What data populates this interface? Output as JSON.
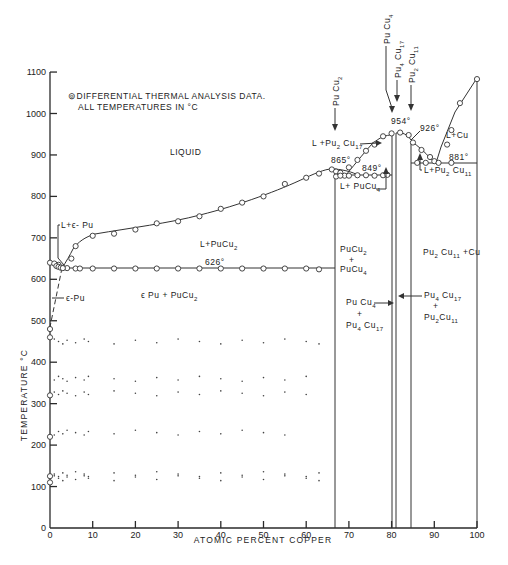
{
  "chart_data": {
    "type": "scatter",
    "xlabel": "ATOMIC PERCENT COPPER",
    "ylabel": "TEMPERATURE °C",
    "xlim": [
      0,
      100
    ],
    "ylim": [
      0,
      1100
    ],
    "x_ticks": [
      0,
      10,
      20,
      30,
      40,
      50,
      60,
      70,
      80,
      90,
      100
    ],
    "y_ticks": [
      0,
      100,
      200,
      300,
      400,
      500,
      600,
      700,
      800,
      900,
      1000,
      1100
    ],
    "grid": false,
    "legend_note": [
      "⊚DIFFERENTIAL THERMAL ANALYSIS DATA.",
      "ALL TEMPERATURES IN °C"
    ],
    "compound_lines": [
      {
        "name": "PuCu2",
        "x": 66.7,
        "top": 865
      },
      {
        "name": "PuCu4",
        "x": 80.0,
        "top": 950
      },
      {
        "name": "Pu4Cu17",
        "x": 81.0,
        "top": 954
      },
      {
        "name": "Pu2Cu11",
        "x": 84.6,
        "top": 926
      },
      {
        "name": "Cu",
        "x": 100.0,
        "top": 1083
      }
    ],
    "isotherms": [
      {
        "label": "626°",
        "temp": 626,
        "x_range": [
          3,
          66.7
        ]
      },
      {
        "label": "849°",
        "temp": 849,
        "x_range": [
          66.7,
          80
        ]
      },
      {
        "label": "881°",
        "temp": 881,
        "x_range": [
          84.6,
          100
        ]
      }
    ],
    "temperature_labels": [
      "954°",
      "926°",
      "865°",
      "849°",
      "626°",
      "881°"
    ],
    "dta_points": {
      "liquidus_pucu2": [
        [
          2,
          635
        ],
        [
          5,
          650
        ],
        [
          6,
          680
        ],
        [
          10,
          705
        ],
        [
          15,
          710
        ],
        [
          20,
          720
        ],
        [
          25,
          735
        ],
        [
          30,
          740
        ],
        [
          35,
          752
        ],
        [
          40,
          770
        ],
        [
          45,
          785
        ],
        [
          50,
          800
        ],
        [
          55,
          830
        ],
        [
          60,
          845
        ],
        [
          63,
          855
        ],
        [
          66,
          865
        ]
      ],
      "eutectic_626": [
        [
          3,
          628
        ],
        [
          4,
          627
        ],
        [
          6,
          626
        ],
        [
          7,
          626
        ],
        [
          10,
          626
        ],
        [
          15,
          626
        ],
        [
          20,
          626
        ],
        [
          25,
          626
        ],
        [
          30,
          626
        ],
        [
          35,
          626
        ],
        [
          40,
          626
        ],
        [
          45,
          626
        ],
        [
          50,
          626
        ],
        [
          55,
          626
        ],
        [
          60,
          626
        ],
        [
          63,
          624
        ]
      ],
      "pu_rich": [
        [
          0,
          640
        ],
        [
          1,
          638
        ],
        [
          1.5,
          632
        ],
        [
          2,
          630
        ],
        [
          2.5,
          628
        ],
        [
          3,
          627
        ],
        [
          0,
          480
        ],
        [
          0,
          460
        ],
        [
          0,
          320
        ],
        [
          0,
          220
        ],
        [
          0,
          125
        ],
        [
          0,
          110
        ]
      ],
      "liquidus_pucu4": [
        [
          67,
          860
        ],
        [
          68,
          857
        ],
        [
          69,
          850
        ],
        [
          70,
          870
        ],
        [
          72,
          888
        ],
        [
          74,
          910
        ],
        [
          76,
          925
        ],
        [
          78,
          945
        ],
        [
          80,
          952
        ]
      ],
      "liquidus_pu2cu11": [
        [
          82,
          954
        ],
        [
          84,
          948
        ],
        [
          85,
          930
        ],
        [
          87,
          912
        ],
        [
          89,
          895
        ],
        [
          90,
          885
        ]
      ],
      "solidus_849": [
        [
          67,
          848
        ],
        [
          68,
          850
        ],
        [
          70,
          850
        ],
        [
          72,
          851
        ],
        [
          74,
          851
        ],
        [
          76,
          850
        ],
        [
          78,
          851
        ],
        [
          79,
          852
        ]
      ],
      "cu_liquidus": [
        [
          93,
          925
        ],
        [
          94,
          960
        ],
        [
          96,
          1025
        ],
        [
          100,
          1083
        ]
      ],
      "eutectic_881": [
        [
          86,
          881
        ],
        [
          88,
          881
        ],
        [
          91,
          881
        ],
        [
          94,
          881
        ]
      ]
    }
  },
  "axis": {
    "ylabel": "TEMPERATURE °C",
    "xlabel": "ATOMIC PERCENT COPPER",
    "y_tick_labels": [
      "0",
      "100",
      "200",
      "300",
      "400",
      "500",
      "600",
      "700",
      "800",
      "900",
      "1000",
      "1100"
    ],
    "x_tick_labels": [
      "0",
      "10",
      "20",
      "30",
      "40",
      "50",
      "60",
      "70",
      "80",
      "90",
      "100"
    ]
  },
  "notes": {
    "line1": "⊚DIFFERENTIAL THERMAL ANALYSIS DATA.",
    "line2": "ALL TEMPERATURES IN °C"
  },
  "regions": {
    "liquid": "LIQUID",
    "l_pucu2": "L+PuCu",
    "l_pucu2_sub": "2",
    "eps_pu_pucu2": "ϵ Pu + PuCu",
    "eps_pu_pucu2_sub": "2",
    "l_eps_pu": "L+ϵ- Pu",
    "eps_pu": "ϵ-Pu",
    "l_cu": "L+Cu",
    "pu2cu11_cu": "Pu",
    "l_pu4cu17": "L +Pu",
    "l_pucu4": "L+ PuCu",
    "l_pu2cu11": "L+Pu"
  },
  "temps": {
    "t954": "954°",
    "t926": "926°",
    "t865": "865°",
    "t849": "849°",
    "t626": "626°",
    "t881": "881°"
  },
  "compounds": {
    "pucu2": "Pu Cu",
    "pucu4": "Pu Cu",
    "pu4cu17": "Pu",
    "pu2cu11": "Pu"
  }
}
